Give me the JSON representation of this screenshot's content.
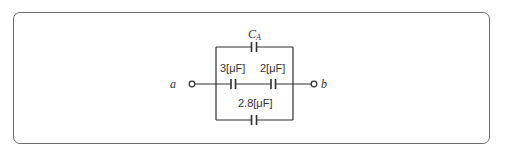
{
  "diagram": {
    "type": "capacitor-circuit",
    "terminals": {
      "left": "a",
      "right": "b"
    },
    "capacitors": {
      "top": {
        "label_main": "C",
        "label_sub": "A"
      },
      "middle_left": {
        "label": "3[μF]"
      },
      "middle_right": {
        "label": "2[μF]"
      },
      "bottom": {
        "label": "2.8[μF]"
      }
    },
    "colors": {
      "frame": "#6b6b6b",
      "wire": "#2e2e2e",
      "text": "#333333"
    }
  }
}
